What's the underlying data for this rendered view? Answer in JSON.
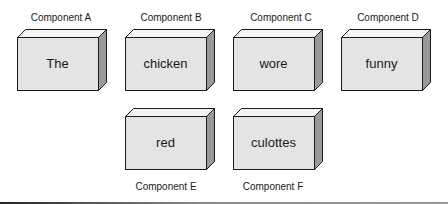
{
  "colors": {
    "front_face": "#e4e4e4",
    "top_face": "#f4f4f4",
    "side_face": "#9a9a9a",
    "outline": "#1a1a1a"
  },
  "components": [
    {
      "id": "A",
      "label": "Component A",
      "word": "The",
      "label_position": "top"
    },
    {
      "id": "B",
      "label": "Component B",
      "word": "chicken",
      "label_position": "top"
    },
    {
      "id": "C",
      "label": "Component C",
      "word": "wore",
      "label_position": "top"
    },
    {
      "id": "D",
      "label": "Component D",
      "word": "funny",
      "label_position": "top"
    },
    {
      "id": "E",
      "label": "Component E",
      "word": "red",
      "label_position": "bottom"
    },
    {
      "id": "F",
      "label": "Component F",
      "word": "culottes",
      "label_position": "bottom"
    }
  ]
}
